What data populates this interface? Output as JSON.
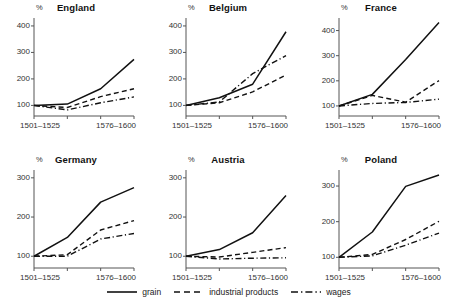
{
  "chart_data": {
    "type": "line",
    "title": "",
    "subtitle": "",
    "layout": "small-multiples 2 rows x 3 columns",
    "xlabel": "",
    "ylabel": "%",
    "x": [
      "1501–1525",
      "1526–1550",
      "1551–1575",
      "1576–1600"
    ],
    "x_tick_labels_shown": [
      "1501–1525",
      "1576–1600"
    ],
    "grid": false,
    "legend_position": "bottom-center",
    "legend": [
      "grain",
      "industrial products",
      "wages"
    ],
    "series_styles": {
      "grain": "solid",
      "industrial products": "dashed",
      "wages": "dash-dot"
    },
    "base_index_note": "1501–1525 = 100",
    "panels": [
      {
        "name": "England",
        "ylim": [
          60,
          430
        ],
        "yticks": [
          100,
          200,
          300,
          400
        ],
        "series": [
          {
            "name": "grain",
            "values": [
              100,
              105,
              163,
              274
            ]
          },
          {
            "name": "industrial products",
            "values": [
              100,
              92,
              133,
              163
            ]
          },
          {
            "name": "wages",
            "values": [
              100,
              83,
              110,
              132
            ]
          }
        ]
      },
      {
        "name": "Belgium",
        "ylim": [
          60,
          430
        ],
        "yticks": [
          100,
          200,
          300,
          400
        ],
        "series": [
          {
            "name": "grain",
            "values": [
              100,
              129,
              180,
              378
            ]
          },
          {
            "name": "industrial products",
            "values": [
              100,
              110,
              151,
              215
            ]
          },
          {
            "name": "wages",
            "values": [
              100,
              113,
              220,
              288
            ]
          }
        ]
      },
      {
        "name": "France",
        "ylim": [
          60,
          450
        ],
        "yticks": [
          100,
          200,
          300,
          400
        ],
        "series": [
          {
            "name": "grain",
            "values": [
              100,
              146,
              285,
              432
            ]
          },
          {
            "name": "industrial products",
            "values": [
              100,
              142,
              115,
              201
            ]
          },
          {
            "name": "wages",
            "values": [
              100,
              110,
              114,
              127
            ]
          }
        ]
      },
      {
        "name": "Germany",
        "ylim": [
          70,
          320
        ],
        "yticks": [
          100,
          200,
          300
        ],
        "series": [
          {
            "name": "grain",
            "values": [
              100,
              148,
              238,
              275
            ]
          },
          {
            "name": "industrial products",
            "values": [
              100,
              104,
              167,
              191
            ]
          },
          {
            "name": "wages",
            "values": [
              100,
              100,
              144,
              158
            ]
          }
        ]
      },
      {
        "name": "Austria",
        "ylim": [
          70,
          320
        ],
        "yticks": [
          100,
          200,
          300
        ],
        "series": [
          {
            "name": "grain",
            "values": [
              100,
              117,
              160,
              255
            ]
          },
          {
            "name": "industrial products",
            "values": [
              100,
              98,
              110,
              122
            ]
          },
          {
            "name": "wages",
            "values": [
              100,
              93,
              95,
              96
            ]
          }
        ]
      },
      {
        "name": "Poland",
        "ylim": [
          70,
          345
        ],
        "yticks": [
          100,
          200,
          300
        ],
        "series": [
          {
            "name": "grain",
            "values": [
              100,
              171,
              299,
              331
            ]
          },
          {
            "name": "industrial products",
            "values": [
              100,
              108,
              150,
              201
            ]
          },
          {
            "name": "wages",
            "values": [
              100,
              104,
              134,
              168
            ]
          }
        ]
      }
    ]
  },
  "axis": {
    "percent_symbol": "%"
  }
}
